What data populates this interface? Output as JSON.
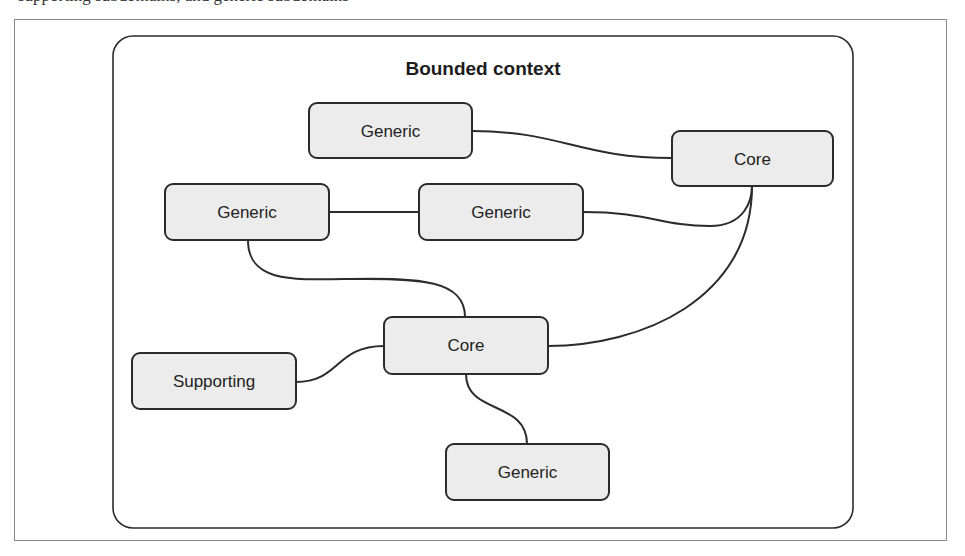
{
  "top_text": {
    "clipped_line": "supporting subdomains, and generic subdomains"
  },
  "diagram": {
    "container": {
      "title": "Bounded context",
      "x": 113,
      "y": 36,
      "width": 740,
      "height": 492,
      "radius": 20
    },
    "nodes": [
      {
        "id": "generic-top",
        "label": "Generic",
        "type": "generic",
        "x": 309,
        "y": 103,
        "width": 163,
        "height": 55
      },
      {
        "id": "core-top-right",
        "label": "Core",
        "type": "core",
        "x": 672,
        "y": 131,
        "width": 161,
        "height": 55
      },
      {
        "id": "generic-left",
        "label": "Generic",
        "type": "generic",
        "x": 165,
        "y": 184,
        "width": 164,
        "height": 56
      },
      {
        "id": "generic-middle",
        "label": "Generic",
        "type": "generic",
        "x": 419,
        "y": 184,
        "width": 164,
        "height": 56
      },
      {
        "id": "core-center",
        "label": "Core",
        "type": "core",
        "x": 384,
        "y": 317,
        "width": 164,
        "height": 57
      },
      {
        "id": "supporting",
        "label": "Supporting",
        "type": "supporting",
        "x": 132,
        "y": 353,
        "width": 164,
        "height": 56
      },
      {
        "id": "generic-bottom",
        "label": "Generic",
        "type": "generic",
        "x": 446,
        "y": 444,
        "width": 163,
        "height": 56
      }
    ],
    "edges": [
      {
        "from": "generic-top",
        "to": "core-top-right"
      },
      {
        "from": "generic-left",
        "to": "generic-middle"
      },
      {
        "from": "generic-middle",
        "to": "core-top-right"
      },
      {
        "from": "core-top-right",
        "to": "core-center"
      },
      {
        "from": "generic-left",
        "to": "core-center"
      },
      {
        "from": "supporting",
        "to": "core-center"
      },
      {
        "from": "core-center",
        "to": "generic-bottom"
      }
    ]
  },
  "colors": {
    "node_fill": "#ececec",
    "stroke": "#2b2b2b",
    "frame": "#8a8a8a",
    "background": "#ffffff"
  }
}
